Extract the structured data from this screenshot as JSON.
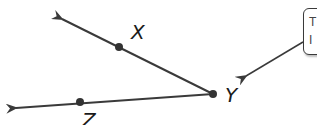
{
  "diagram": {
    "stroke_color": "#3a3a3a",
    "point_color": "#333333",
    "vertex": {
      "label": "Y",
      "x": 213,
      "y": 94
    },
    "points": [
      {
        "label": "X",
        "x": 119,
        "y": 47,
        "label_x": 131,
        "label_y": 22
      },
      {
        "label": "Z",
        "x": 80,
        "y": 102,
        "label_x": 82,
        "label_y": 110
      }
    ],
    "rays": [
      {
        "name": "ray-YX",
        "from": [
          213,
          94
        ],
        "to": [
          60,
          18
        ]
      },
      {
        "name": "ray-YZ",
        "from": [
          213,
          94
        ],
        "to": [
          14,
          108
        ]
      }
    ],
    "vertex_label": {
      "text": "Y",
      "x": 225,
      "y": 85
    },
    "callout": {
      "line1": "T",
      "line2": "I",
      "arrow_from": [
        303,
        42
      ],
      "arrow_to": [
        243,
        78
      ],
      "clipped": true
    }
  }
}
